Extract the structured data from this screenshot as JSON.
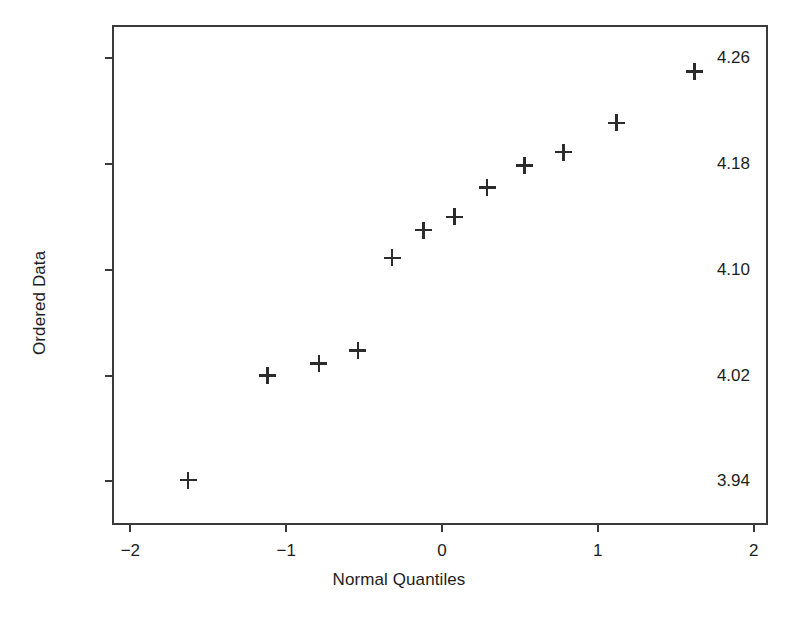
{
  "chart_data": {
    "type": "scatter",
    "title": "",
    "xlabel": "Normal Quantiles",
    "ylabel": "Ordered Data",
    "xlim": [
      -2.105,
      2.105
    ],
    "ylim": [
      3.9055,
      4.2835
    ],
    "xticks": [
      -2,
      -1,
      0,
      1,
      2
    ],
    "xticklabels": [
      "−2",
      "−1",
      "0",
      "1",
      "2"
    ],
    "yticks": [
      3.94,
      4.02,
      4.1,
      4.18,
      4.26
    ],
    "yticklabels": [
      "3.94",
      "4.02",
      "4.10",
      "4.18",
      "4.26"
    ],
    "grid": false,
    "legend": null,
    "marker": "plus",
    "marker_color": "#2b2b2b",
    "frame_color": "#3a3a3a",
    "background": "#ffffff",
    "n_points": 12,
    "x": [
      -1.63,
      -1.12,
      -0.79,
      -0.54,
      -0.32,
      -0.12,
      0.08,
      0.29,
      0.53,
      0.78,
      1.12,
      1.62
    ],
    "y": [
      3.941,
      4.02,
      4.029,
      4.039,
      4.109,
      4.13,
      4.14,
      4.162,
      4.179,
      4.189,
      4.211,
      4.25
    ],
    "points": [
      {
        "x": -1.63,
        "y": 3.941
      },
      {
        "x": -1.12,
        "y": 4.02
      },
      {
        "x": -0.79,
        "y": 4.029
      },
      {
        "x": -0.54,
        "y": 4.039
      },
      {
        "x": -0.32,
        "y": 4.109
      },
      {
        "x": -0.12,
        "y": 4.13
      },
      {
        "x": 0.08,
        "y": 4.14
      },
      {
        "x": 0.29,
        "y": 4.162
      },
      {
        "x": 0.53,
        "y": 4.179
      },
      {
        "x": 0.78,
        "y": 4.189
      },
      {
        "x": 1.12,
        "y": 4.211
      },
      {
        "x": 1.62,
        "y": 4.25
      }
    ]
  },
  "caption": ""
}
